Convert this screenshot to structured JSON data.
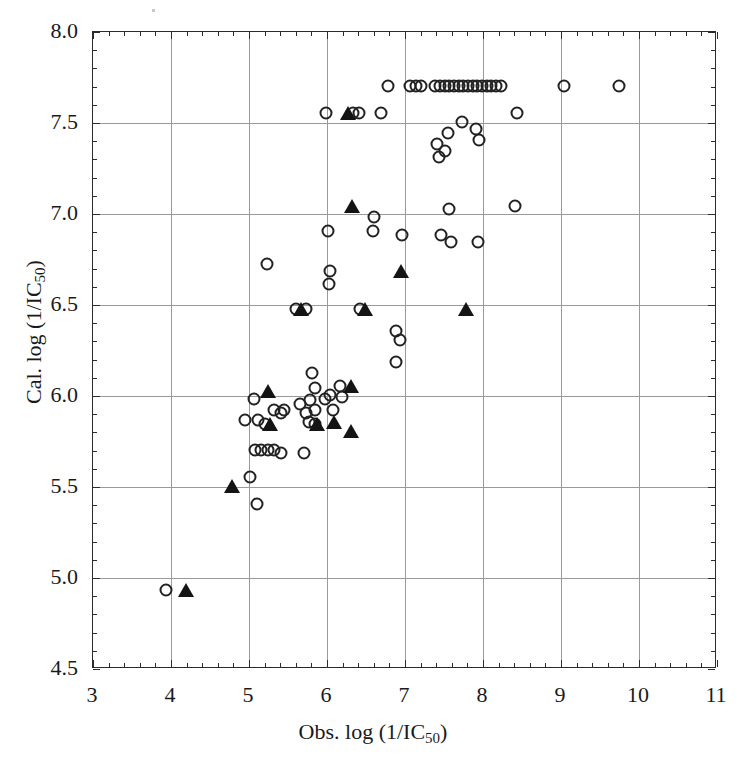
{
  "figure": {
    "background": "#ffffff",
    "frame_color": "#2b2b2b",
    "grid_color": "#9a9a9a",
    "marker_color": "#222222"
  },
  "axes": {
    "x_title_prefix": "Obs. log (1/IC",
    "x_title_sub": "50",
    "x_title_suffix": ")",
    "y_title_prefix": "Cal. log (1/IC",
    "y_title_sub": "50",
    "y_title_suffix": ")",
    "x_ticks": [
      "3",
      "4",
      "5",
      "6",
      "7",
      "8",
      "9",
      "10",
      "11"
    ],
    "y_ticks": [
      "4.5",
      "5.0",
      "5.5",
      "6.0",
      "6.5",
      "7.0",
      "7.5",
      "8.0"
    ]
  },
  "chart_data": {
    "type": "scatter",
    "title": "",
    "xlabel": "Obs. log (1/IC50)",
    "ylabel": "Cal. log (1/IC50)",
    "xlim": [
      3,
      11
    ],
    "ylim": [
      4.5,
      8.0
    ],
    "xticks": [
      3,
      4,
      5,
      6,
      7,
      8,
      9,
      10,
      11
    ],
    "yticks": [
      4.5,
      5.0,
      5.5,
      6.0,
      6.5,
      7.0,
      7.5,
      8.0
    ],
    "grid": true,
    "legend": "none",
    "series": [
      {
        "name": "open-circle",
        "marker": "open circle",
        "points": [
          [
            3.95,
            4.93
          ],
          [
            5.02,
            5.55
          ],
          [
            5.12,
            5.4
          ],
          [
            5.08,
            5.98
          ],
          [
            4.96,
            5.86
          ],
          [
            5.13,
            5.86
          ],
          [
            5.22,
            5.84
          ],
          [
            5.09,
            5.7
          ],
          [
            5.17,
            5.7
          ],
          [
            5.25,
            5.7
          ],
          [
            5.33,
            5.7
          ],
          [
            5.42,
            5.68
          ],
          [
            5.33,
            5.92
          ],
          [
            5.42,
            5.9
          ],
          [
            5.46,
            5.92
          ],
          [
            5.67,
            5.95
          ],
          [
            5.74,
            5.9
          ],
          [
            5.8,
            5.97
          ],
          [
            5.86,
            5.92
          ],
          [
            5.78,
            5.85
          ],
          [
            5.86,
            5.84
          ],
          [
            5.82,
            6.12
          ],
          [
            5.86,
            6.04
          ],
          [
            5.99,
            5.98
          ],
          [
            6.05,
            6.0
          ],
          [
            6.09,
            5.92
          ],
          [
            6.2,
            5.99
          ],
          [
            6.18,
            6.05
          ],
          [
            5.72,
            5.68
          ],
          [
            5.24,
            6.72
          ],
          [
            5.62,
            6.47
          ],
          [
            5.74,
            6.47
          ],
          [
            6.02,
            6.9
          ],
          [
            6.05,
            6.68
          ],
          [
            6.04,
            6.61
          ],
          [
            6.0,
            7.55
          ],
          [
            6.35,
            7.55
          ],
          [
            6.42,
            7.55
          ],
          [
            6.7,
            7.55
          ],
          [
            6.44,
            6.47
          ],
          [
            6.62,
            6.98
          ],
          [
            6.6,
            6.9
          ],
          [
            6.9,
            6.35
          ],
          [
            6.95,
            6.3
          ],
          [
            6.9,
            6.18
          ],
          [
            6.98,
            6.88
          ],
          [
            7.47,
            6.88
          ],
          [
            7.6,
            6.84
          ],
          [
            7.58,
            7.02
          ],
          [
            7.95,
            6.84
          ],
          [
            7.42,
            7.38
          ],
          [
            7.45,
            7.31
          ],
          [
            7.52,
            7.34
          ],
          [
            7.56,
            7.44
          ],
          [
            7.74,
            7.5
          ],
          [
            7.92,
            7.46
          ],
          [
            7.96,
            7.4
          ],
          [
            8.42,
            7.04
          ],
          [
            6.8,
            7.7
          ],
          [
            7.08,
            7.7
          ],
          [
            7.15,
            7.7
          ],
          [
            7.22,
            7.7
          ],
          [
            7.4,
            7.7
          ],
          [
            7.46,
            7.7
          ],
          [
            7.52,
            7.7
          ],
          [
            7.58,
            7.7
          ],
          [
            7.64,
            7.7
          ],
          [
            7.7,
            7.7
          ],
          [
            7.76,
            7.7
          ],
          [
            7.82,
            7.7
          ],
          [
            7.88,
            7.7
          ],
          [
            7.94,
            7.7
          ],
          [
            8.0,
            7.7
          ],
          [
            8.06,
            7.7
          ],
          [
            8.12,
            7.7
          ],
          [
            8.18,
            7.7
          ],
          [
            8.24,
            7.7
          ],
          [
            9.05,
            7.7
          ],
          [
            9.75,
            7.7
          ],
          [
            8.45,
            7.55
          ]
        ]
      },
      {
        "name": "filled-triangle",
        "marker": "filled triangle",
        "points": [
          [
            4.2,
            4.93
          ],
          [
            4.8,
            5.5
          ],
          [
            5.26,
            6.02
          ],
          [
            5.28,
            5.84
          ],
          [
            5.68,
            6.47
          ],
          [
            5.88,
            5.84
          ],
          [
            6.1,
            5.85
          ],
          [
            6.28,
            7.55
          ],
          [
            6.32,
            6.05
          ],
          [
            6.33,
            7.04
          ],
          [
            6.32,
            5.8
          ],
          [
            6.5,
            6.47
          ],
          [
            6.96,
            6.68
          ],
          [
            7.8,
            6.47
          ]
        ]
      }
    ]
  }
}
